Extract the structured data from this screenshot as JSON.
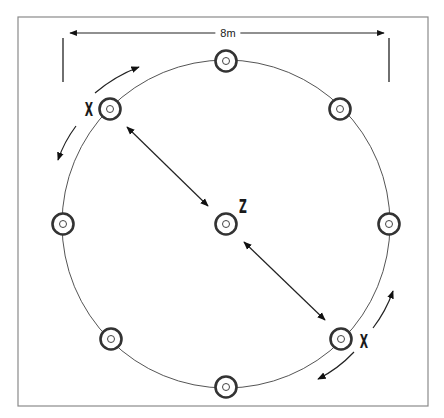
{
  "diagram": {
    "frame": {
      "x": 18,
      "y": 17,
      "w": 410,
      "h": 389,
      "stroke": "#8a8a8a"
    },
    "dimension": {
      "label": "8m",
      "y": 33,
      "x1": 65,
      "x2": 389,
      "label_x": 228
    },
    "circle": {
      "cx": 226,
      "cy": 224,
      "r": 164,
      "stroke": "#555555"
    },
    "markers": [
      {
        "id": "top",
        "x": 226,
        "y": 61
      },
      {
        "id": "top-right",
        "x": 340,
        "y": 109
      },
      {
        "id": "right",
        "x": 389,
        "y": 224
      },
      {
        "id": "bottom-right",
        "x": 341,
        "y": 339
      },
      {
        "id": "bottom",
        "x": 226,
        "y": 387
      },
      {
        "id": "bottom-left",
        "x": 111,
        "y": 339
      },
      {
        "id": "left",
        "x": 63,
        "y": 224
      },
      {
        "id": "top-left",
        "x": 110,
        "y": 109
      },
      {
        "id": "center",
        "x": 226,
        "y": 224
      }
    ],
    "labels": [
      {
        "id": "player-x-top-left",
        "text": "X",
        "x": 89,
        "y": 109
      },
      {
        "id": "player-z-center",
        "text": "Z",
        "x": 243,
        "y": 206
      },
      {
        "id": "player-x-bottom-right",
        "text": "X",
        "x": 364,
        "y": 341
      }
    ]
  }
}
